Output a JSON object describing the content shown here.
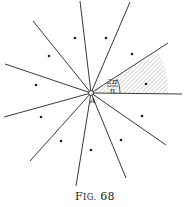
{
  "figure": {
    "caption_prefix": "F",
    "caption_smallcaps": "IG.",
    "caption_number": "68",
    "center_label": "A",
    "angle_label": {
      "numerator": "2π",
      "denominator": "n"
    },
    "center": [
      91,
      93
    ],
    "rays": [
      [
        182,
        94
      ],
      [
        168,
        43
      ],
      [
        130,
        2
      ],
      [
        80,
        1
      ],
      [
        33,
        21
      ],
      [
        5,
        64
      ],
      [
        4,
        117
      ],
      [
        30,
        161
      ],
      [
        76,
        186
      ],
      [
        126,
        178
      ],
      [
        166,
        145
      ]
    ],
    "dots": [
      [
        146,
        84
      ],
      [
        132,
        54
      ],
      [
        106,
        38
      ],
      [
        75,
        38
      ],
      [
        49,
        56
      ],
      [
        36,
        85
      ],
      [
        41,
        117
      ],
      [
        61,
        141
      ],
      [
        91,
        150
      ],
      [
        121,
        140
      ],
      [
        142,
        116
      ]
    ],
    "colors": {
      "ink": "#222222",
      "hatch": "#9a9a9a",
      "background": "#ffffff"
    }
  }
}
